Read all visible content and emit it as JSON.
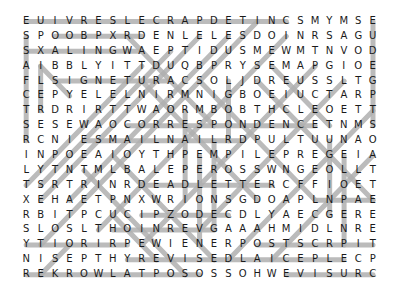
{
  "puzzle": {
    "type": "word-search",
    "columns": 25,
    "rows_count": 18,
    "highlight_color": "#b0b0b0",
    "letter_color": "#1a1a1a",
    "grid": [
      "EUIVRESLECRAPDETINCSMYMSE",
      "SPOOBPXRDENLELESDOINRSAGU",
      "SXALINGWAEPTIDUSMEWMTNVOD",
      "AIBBLYITTDUQBPRYSEMAPGIOE",
      "FLSIGNETURACSOLJDREUSSLTG",
      "CEPYELELNIRMNIGBOEIUCTARP",
      "TRDRIRTTWAORMBOBTHCLEOETT",
      "SESEWAOCORRESPONDENCETNMS",
      "RCNIESMAILNAILRDPULTUUNAO",
      "INPOEAIOYTHPEMPILEPREGEIA",
      "LYTNTMLBALEPEROSSWNGEOLLT",
      "TSRTRINRDEADLETTERCFFIOET",
      "XEHAETPNXWRIONSGDOAPLNPAE",
      "RBITPCUCIPZODECDLYAECGERE",
      "SLOSLTHOINREVGAAAHMIDLNRE",
      "YTIORIRPEWIENERPOSTSCRPIT",
      "NISEPTHYREVISEDLAICEPLECP",
      "REKROWLATPOSOSSOHWEVISURC"
    ],
    "highlights": [
      [
        0,
        0,
        18,
        0
      ],
      [
        2,
        1,
        8,
        1
      ],
      [
        0,
        2,
        8,
        2
      ],
      [
        2,
        4,
        10,
        4
      ],
      [
        7,
        7,
        20,
        7
      ],
      [
        4,
        8,
        15,
        8
      ],
      [
        8,
        11,
        17,
        11
      ],
      [
        20,
        12,
        24,
        12
      ],
      [
        8,
        13,
        14,
        13
      ],
      [
        6,
        14,
        13,
        14
      ],
      [
        0,
        15,
        7,
        15
      ],
      [
        16,
        15,
        24,
        15
      ],
      [
        7,
        16,
        22,
        16
      ],
      [
        0,
        17,
        12,
        17
      ],
      [
        18,
        17,
        24,
        17
      ],
      [
        0,
        1,
        0,
        8
      ],
      [
        24,
        0,
        24,
        7
      ],
      [
        1,
        3,
        1,
        6
      ],
      [
        21,
        8,
        21,
        13
      ],
      [
        22,
        9,
        22,
        15
      ],
      [
        14,
        4,
        14,
        8
      ],
      [
        13,
        8,
        13,
        14
      ],
      [
        12,
        9,
        12,
        15
      ],
      [
        11,
        6,
        11,
        12
      ],
      [
        25,
        12,
        25,
        12
      ],
      [
        8,
        3,
        0,
        11
      ],
      [
        10,
        2,
        1,
        11
      ],
      [
        12,
        1,
        1,
        12
      ],
      [
        14,
        1,
        3,
        12
      ],
      [
        16,
        0,
        1,
        15
      ],
      [
        18,
        1,
        5,
        14
      ],
      [
        20,
        3,
        8,
        15
      ],
      [
        22,
        4,
        12,
        14
      ],
      [
        24,
        6,
        14,
        16
      ],
      [
        24,
        9,
        17,
        16
      ],
      [
        7,
        1,
        13,
        7
      ],
      [
        8,
        4,
        16,
        12
      ],
      [
        12,
        4,
        20,
        12
      ],
      [
        16,
        4,
        24,
        12
      ],
      [
        6,
        9,
        13,
        16
      ],
      [
        4,
        10,
        11,
        17
      ],
      [
        1,
        3,
        3,
        5
      ],
      [
        9,
        16,
        6,
        13
      ],
      [
        3,
        15,
        1,
        17
      ],
      [
        17,
        3,
        21,
        7
      ]
    ]
  }
}
